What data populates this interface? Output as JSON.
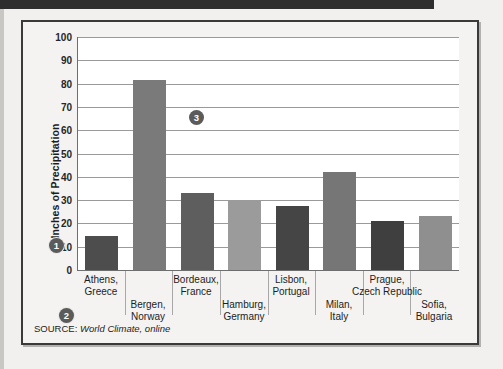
{
  "figure": {
    "source_label": "SOURCE:",
    "source_value": "World Climate, online"
  },
  "callouts": [
    {
      "id": "callout-1",
      "label": "1"
    },
    {
      "id": "callout-2",
      "label": "2"
    },
    {
      "id": "callout-3",
      "label": "3"
    }
  ],
  "chart_data": {
    "type": "bar",
    "title": "",
    "xlabel": "",
    "ylabel": "Inches of Precipitation",
    "ylim": [
      0,
      100
    ],
    "ytick_step": 10,
    "yticks": [
      0,
      10,
      20,
      30,
      40,
      50,
      60,
      70,
      80,
      90,
      100
    ],
    "grid": true,
    "legend": false,
    "categories": [
      "Athens, Greece",
      "Bergen, Norway",
      "Bordeaux, France",
      "Hamburg, Germany",
      "Lisbon, Portugal",
      "Milan, Italy",
      "Prague, Czech Republic",
      "Sofia, Bulgaria"
    ],
    "category_lines": [
      [
        "Athens,",
        "Greece"
      ],
      [
        "Bergen,",
        "Norway"
      ],
      [
        "Bordeaux,",
        "France"
      ],
      [
        "Hamburg,",
        "Germany"
      ],
      [
        "Lisbon,",
        "Portugal"
      ],
      [
        "Milan,",
        "Italy"
      ],
      [
        "Prague,",
        "Czech Republic"
      ],
      [
        "Sofia,",
        "Bulgaria"
      ]
    ],
    "values": [
      14.5,
      81.5,
      33,
      30,
      27.5,
      42,
      21,
      23
    ],
    "colors": [
      "#4d4d4d",
      "#7a7a7a",
      "#5e5e5e",
      "#9b9b9b",
      "#454545",
      "#767676",
      "#3f3f3f",
      "#8f8f8f"
    ]
  },
  "colors": {
    "grid": "#9a9a9a",
    "axis": "#6e6e6e",
    "frame": "#3a3a3a",
    "plot_background": "#ffffff",
    "figure_background": "#f4f3f1",
    "callout_background": "#5b5b5b",
    "text": "#1d1d1d"
  }
}
